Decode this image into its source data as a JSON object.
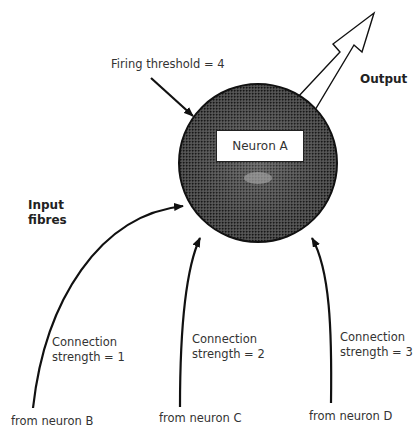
{
  "diagram": {
    "neuron": {
      "label": "Neuron A",
      "firing_threshold_label": "Firing threshold = 4"
    },
    "output_label": "Output",
    "input_label_line1": "Input",
    "input_label_line2": "fibres",
    "inputs": [
      {
        "source": "from neuron B",
        "strength_line1": "Connection",
        "strength_line2": "strength = 1"
      },
      {
        "source": "from neuron C",
        "strength_line1": "Connection",
        "strength_line2": "strength = 2"
      },
      {
        "source": "from neuron D",
        "strength_line1": "Connection",
        "strength_line2": "strength = 3"
      }
    ],
    "colors": {
      "stroke": "#111111",
      "fill_dark": "#3a3a3a",
      "fill_light": "#9a9a9a",
      "background": "#ffffff"
    }
  }
}
